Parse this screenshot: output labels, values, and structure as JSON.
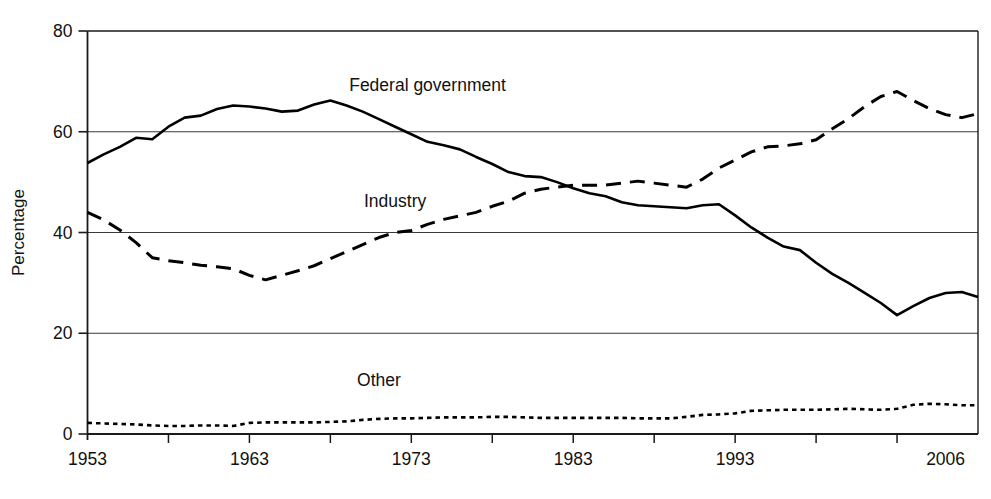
{
  "chart_data": {
    "type": "line",
    "title": "",
    "xlabel": "",
    "ylabel": "Percentage",
    "xlim": [
      1953,
      2008
    ],
    "ylim": [
      0,
      80
    ],
    "yticks": [
      0,
      20,
      40,
      60,
      80
    ],
    "xticks": [
      1953,
      1963,
      1973,
      1983,
      1993,
      2006
    ],
    "xtick_labels": [
      "1953",
      "1963",
      "1973",
      "1983",
      "1993",
      "2006"
    ],
    "ytick_labels": [
      "0",
      "20",
      "40",
      "60",
      "80"
    ],
    "grid": "horizontal",
    "legend": "inline-annotations",
    "x": [
      1953,
      1954,
      1955,
      1956,
      1957,
      1958,
      1959,
      1960,
      1961,
      1962,
      1963,
      1964,
      1965,
      1966,
      1967,
      1968,
      1969,
      1970,
      1971,
      1972,
      1973,
      1974,
      1975,
      1976,
      1977,
      1978,
      1979,
      1980,
      1981,
      1982,
      1983,
      1984,
      1985,
      1986,
      1987,
      1988,
      1989,
      1990,
      1991,
      1992,
      1993,
      1994,
      1995,
      1996,
      1997,
      1998,
      1999,
      2000,
      2001,
      2002,
      2003,
      2004,
      2005,
      2006,
      2007,
      2008
    ],
    "series": [
      {
        "name": "Federal government",
        "style": "solid",
        "color": "#000000",
        "label_x": 1974,
        "label_y": 68,
        "values": [
          53.8,
          55.5,
          57.0,
          58.8,
          58.5,
          61.0,
          62.8,
          63.2,
          64.5,
          65.2,
          65.0,
          64.6,
          64.0,
          64.2,
          65.4,
          66.2,
          65.2,
          64.0,
          62.5,
          61.0,
          59.5,
          58.0,
          57.3,
          56.5,
          55.0,
          53.6,
          52.0,
          51.2,
          51.0,
          50.0,
          48.8,
          47.8,
          47.2,
          46.0,
          45.4,
          45.2,
          45.0,
          44.8,
          45.4,
          45.6,
          43.4,
          41.0,
          39.0,
          37.2,
          36.5,
          34.0,
          31.8,
          30.0,
          28.0,
          26.0,
          23.6,
          25.4,
          27.0,
          28.0,
          28.2,
          27.2
        ]
      },
      {
        "name": "Industry",
        "style": "dashed",
        "color": "#000000",
        "label_x": 1972,
        "label_y": 45,
        "values": [
          44.0,
          42.5,
          40.5,
          38.0,
          35.0,
          34.4,
          34.0,
          33.5,
          33.2,
          32.8,
          31.5,
          30.6,
          31.5,
          32.4,
          33.4,
          34.8,
          36.2,
          37.6,
          39.0,
          40.0,
          40.4,
          41.6,
          42.6,
          43.3,
          44.0,
          45.2,
          46.2,
          47.8,
          48.6,
          49.0,
          49.4,
          49.4,
          49.4,
          49.8,
          50.2,
          49.8,
          49.4,
          49.0,
          50.6,
          52.8,
          54.4,
          56.0,
          57.0,
          57.2,
          57.6,
          58.4,
          60.6,
          62.6,
          65.0,
          67.0,
          68.0,
          66.2,
          64.6,
          63.4,
          62.8,
          63.6
        ]
      },
      {
        "name": "Other",
        "style": "dotted",
        "color": "#000000",
        "label_x": 1971,
        "label_y": 9.5,
        "values": [
          2.2,
          2.1,
          2.0,
          1.9,
          1.7,
          1.6,
          1.6,
          1.7,
          1.7,
          1.6,
          2.2,
          2.3,
          2.3,
          2.3,
          2.3,
          2.4,
          2.5,
          2.8,
          3.0,
          3.1,
          3.1,
          3.2,
          3.3,
          3.3,
          3.3,
          3.4,
          3.4,
          3.3,
          3.2,
          3.2,
          3.2,
          3.2,
          3.2,
          3.2,
          3.1,
          3.1,
          3.1,
          3.4,
          3.8,
          3.9,
          4.1,
          4.6,
          4.7,
          4.8,
          4.8,
          4.8,
          4.9,
          5.0,
          4.9,
          4.8,
          5.0,
          5.8,
          6.0,
          5.9,
          5.7,
          5.7
        ]
      }
    ]
  }
}
